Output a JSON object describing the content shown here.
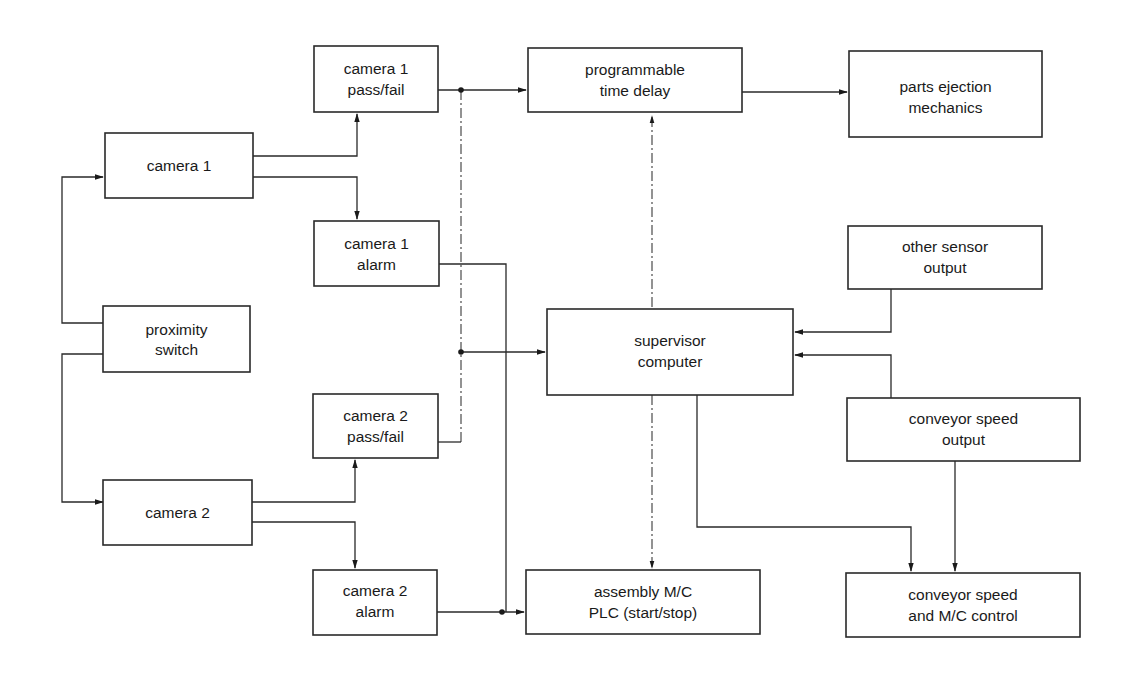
{
  "diagram": {
    "type": "block-diagram",
    "blocks": {
      "camera1": [
        "camera 1"
      ],
      "proximity": [
        "proximity",
        "switch"
      ],
      "camera2": [
        "camera 2"
      ],
      "cam1_passfail": [
        "camera 1",
        "pass/fail"
      ],
      "cam1_alarm": [
        "camera 1",
        "alarm"
      ],
      "cam2_passfail": [
        "camera 2",
        "pass/fail"
      ],
      "cam2_alarm": [
        "camera 2",
        "alarm"
      ],
      "time_delay": [
        "programmable",
        "time delay"
      ],
      "supervisor": [
        "supervisor",
        "computer"
      ],
      "plc": [
        "assembly M/C",
        "PLC (start/stop)"
      ],
      "ejection": [
        "parts ejection",
        "mechanics"
      ],
      "other_sensor": [
        "other sensor",
        "output"
      ],
      "conveyor_output": [
        "conveyor speed",
        "output"
      ],
      "conveyor_control": [
        "conveyor speed",
        "and M/C control"
      ]
    },
    "connections": [
      {
        "from": "proximity switch",
        "to": "camera 1"
      },
      {
        "from": "proximity switch",
        "to": "camera 2"
      },
      {
        "from": "camera 1",
        "to": "camera 1 pass/fail"
      },
      {
        "from": "camera 1",
        "to": "camera 1 alarm"
      },
      {
        "from": "camera 2",
        "to": "camera 2 pass/fail"
      },
      {
        "from": "camera 2",
        "to": "camera 2 alarm"
      },
      {
        "from": "camera 1 pass/fail",
        "to": "programmable time delay"
      },
      {
        "from": "camera 1 pass/fail",
        "to": "supervisor computer"
      },
      {
        "from": "camera 2 pass/fail",
        "to": "supervisor computer"
      },
      {
        "from": "camera 1 alarm",
        "to": "assembly M/C PLC (start/stop)"
      },
      {
        "from": "camera 2 alarm",
        "to": "assembly M/C PLC (start/stop)"
      },
      {
        "from": "programmable time delay",
        "to": "parts ejection mechanics"
      },
      {
        "from": "supervisor computer",
        "to": "programmable time delay"
      },
      {
        "from": "supervisor computer",
        "to": "assembly M/C PLC (start/stop)"
      },
      {
        "from": "supervisor computer",
        "to": "conveyor speed and M/C control"
      },
      {
        "from": "other sensor output",
        "to": "supervisor computer"
      },
      {
        "from": "conveyor speed output",
        "to": "supervisor computer"
      },
      {
        "from": "conveyor speed output",
        "to": "conveyor speed and M/C control"
      }
    ]
  }
}
